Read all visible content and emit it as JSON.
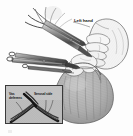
{
  "figure": {
    "type": "medical-surgical-illustration",
    "style": "grayscale line drawing with halftone shading",
    "background_color": "#fdfdfd",
    "width": 133,
    "height": 136
  },
  "labels": {
    "main": "Left hand",
    "inset_left": "Vas deferens",
    "inset_right": "Serosal side"
  },
  "inset": {
    "present": true,
    "border_color": "#3a3a3a",
    "fill_color": "#b9b9b9",
    "x": 5,
    "y": 85,
    "width": 58,
    "height": 39
  },
  "colors": {
    "ink": "#1b1b1b",
    "tissue_fill": "#b4b4b4",
    "tissue_shade": "#9a9a9a",
    "instrument_metal": "#6e6e6e",
    "instrument_dark": "#2a2a2a",
    "paper": "#fdfdfd"
  },
  "anatomy": {
    "structures": [
      "scrotum",
      "vas deferens",
      "surgical field",
      "left hand",
      "fingers",
      "hemostat forceps",
      "ring clamp",
      "dissecting forceps"
    ]
  }
}
